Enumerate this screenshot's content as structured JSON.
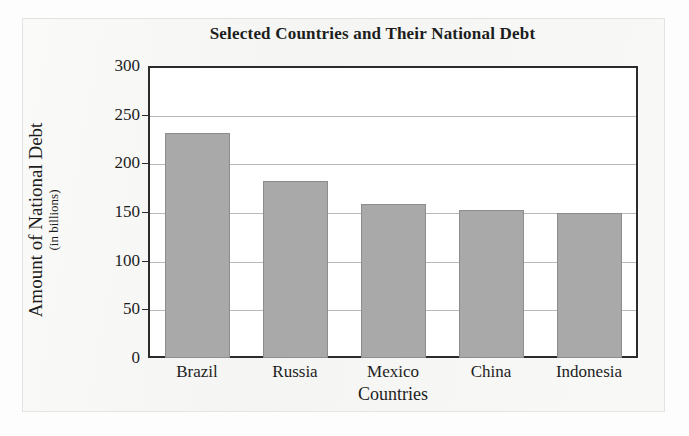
{
  "chart_data": {
    "type": "bar",
    "title": "Selected Countries and Their National Debt",
    "xlabel": "Countries",
    "ylabel": "Amount of National Debt",
    "ylabel_sub": "(in billions)",
    "categories": [
      "Brazil",
      "Russia",
      "Mexico",
      "China",
      "Indonesia"
    ],
    "values": [
      231,
      182,
      158,
      152,
      149
    ],
    "ylim": [
      0,
      300
    ],
    "yticks": [
      0,
      50,
      100,
      150,
      200,
      250,
      300
    ],
    "ytick_labels": [
      "0",
      "50",
      "100",
      "150",
      "200",
      "250",
      "300"
    ],
    "grid": true,
    "grid_axis": "y",
    "legend": false,
    "bar_color": "#a9a9a9",
    "bar_edge_color": "#8d8d8d",
    "axis_color": "#2b2b2b",
    "plot_background": "#ffffff",
    "page_background": "#f4f4f2"
  }
}
